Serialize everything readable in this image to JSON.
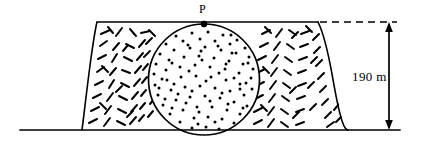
{
  "figure": {
    "type": "engineering-cross-section",
    "background_color": "#ffffff",
    "line_color": "#000000"
  },
  "labels": {
    "point_p": "P",
    "height_dimension": "190 m"
  },
  "geometry": {
    "ground_line": {
      "x1": 20,
      "y1": 130,
      "x2": 400,
      "y2": 130
    },
    "crest_line": {
      "x1": 97,
      "y1": 22,
      "x2": 318,
      "y2": 22
    },
    "left_slope": {
      "top_x": 97,
      "top_y": 22,
      "toe_x": 82,
      "toe_y": 130
    },
    "right_slope": {
      "top_x": 318,
      "top_y": 22,
      "toe_x": 348,
      "toe_y": 130
    },
    "circle": {
      "cx": 204,
      "cy": 79.5,
      "r": 55.5
    },
    "point_p": {
      "x": 204,
      "y": 24,
      "dot_radius": 3.1
    },
    "dashed_extension": {
      "x1": 322,
      "y1": 22,
      "x2": 397,
      "y2": 22
    },
    "dimension_arrow": {
      "x": 389,
      "y_top": 23,
      "y_bottom": 129
    }
  },
  "fills": {
    "hatch_pattern": "short random dashes",
    "circle_pattern": "scattered stipple dots"
  },
  "colors": {
    "stroke": "#000000",
    "background": "#ffffff"
  }
}
